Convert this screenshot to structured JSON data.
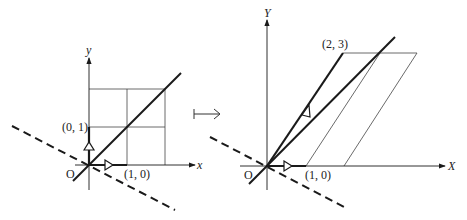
{
  "left": {
    "axis_x_label": "x",
    "axis_y_label": "y",
    "origin_label": "O",
    "point_e1_label": "(1, 0)",
    "point_e2_label": "(0, 1)"
  },
  "maps_to": "↦",
  "right": {
    "axis_x_label": "X",
    "axis_y_label": "Y",
    "origin_label": "O",
    "point_e1_label": "(1, 0)",
    "point_image_label": "(2, 3)"
  },
  "colors": {
    "ink": "#1a1a1a",
    "grid": "#444444"
  }
}
